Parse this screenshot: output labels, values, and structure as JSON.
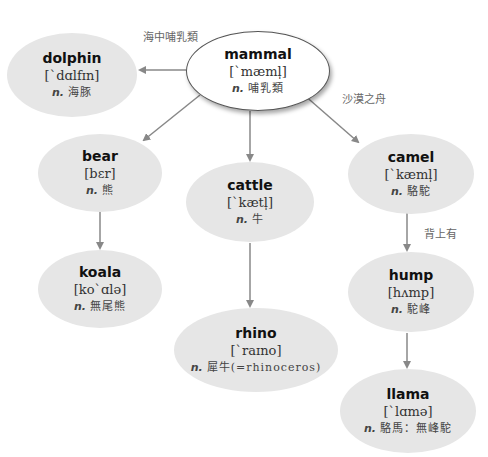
{
  "colors": {
    "node_fill": "#e6e6e6",
    "root_fill": "#ffffff",
    "root_border": "#555555",
    "edge": "#888888"
  },
  "nodes": {
    "mammal": {
      "word": "mammal",
      "ipa": "[ˋmæml̩]",
      "pos": "n.",
      "meaning": "哺乳類"
    },
    "dolphin": {
      "word": "dolphin",
      "ipa": "[ˋdɑlfɪn]",
      "pos": "n.",
      "meaning": "海豚"
    },
    "bear": {
      "word": "bear",
      "ipa": "[bɛr]",
      "pos": "n.",
      "meaning": "熊"
    },
    "cattle": {
      "word": "cattle",
      "ipa": "[ˋkætl̩]",
      "pos": "n.",
      "meaning": "牛"
    },
    "camel": {
      "word": "camel",
      "ipa": "[ˋkæml̩]",
      "pos": "n.",
      "meaning": "駱駝"
    },
    "koala": {
      "word": "koala",
      "ipa": "[koˋɑlə]",
      "pos": "n.",
      "meaning": "無尾熊"
    },
    "rhino": {
      "word": "rhino",
      "ipa": "[ˋraɪno]",
      "pos": "n.",
      "meaning": "犀牛(=rhinoceros)"
    },
    "hump": {
      "word": "hump",
      "ipa": "[hʌmp]",
      "pos": "n.",
      "meaning": "駝峰"
    },
    "llama": {
      "word": "llama",
      "ipa": "[ˋlɑmə]",
      "pos": "n.",
      "meaning": "駱馬：無峰駝"
    }
  },
  "edge_labels": {
    "mammal_dolphin": "海中哺乳類",
    "mammal_camel": "沙漠之舟",
    "camel_hump": "背上有"
  },
  "edges": [
    {
      "from": "mammal",
      "to": "dolphin",
      "label": "海中哺乳類"
    },
    {
      "from": "mammal",
      "to": "bear"
    },
    {
      "from": "mammal",
      "to": "cattle"
    },
    {
      "from": "mammal",
      "to": "camel",
      "label": "沙漠之舟"
    },
    {
      "from": "bear",
      "to": "koala"
    },
    {
      "from": "cattle",
      "to": "rhino"
    },
    {
      "from": "camel",
      "to": "hump",
      "label": "背上有"
    },
    {
      "from": "hump",
      "to": "llama"
    }
  ]
}
